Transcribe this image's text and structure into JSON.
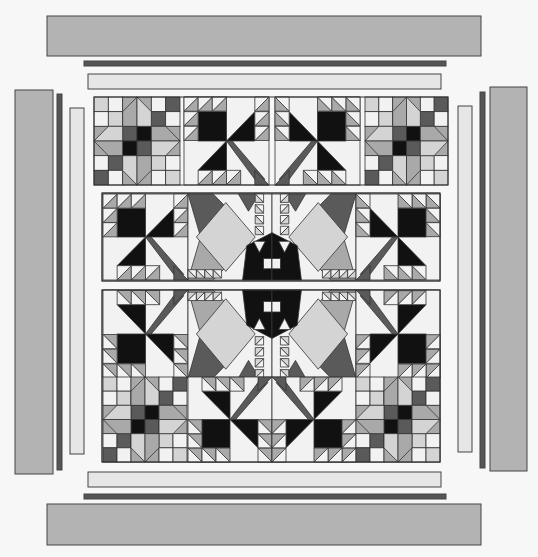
{
  "palette": {
    "white": "#f2f2f2",
    "light": "#d4d4d4",
    "mid": "#a9a9a9",
    "dark": "#5a5a5a",
    "black": "#111111",
    "border_outer": "#b3b3b3",
    "border_inner_dark": "#555555",
    "border_inner_light": "#e6e6e6"
  },
  "borders": [
    {
      "name": "top-outer-border",
      "side": "top",
      "fabric": "border_outer"
    },
    {
      "name": "top-dark-border",
      "side": "top",
      "fabric": "border_inner_dark"
    },
    {
      "name": "top-light-border",
      "side": "top",
      "fabric": "border_inner_light"
    },
    {
      "name": "bottom-light-border",
      "side": "bottom",
      "fabric": "border_inner_light"
    },
    {
      "name": "bottom-dark-border",
      "side": "bottom",
      "fabric": "border_inner_dark"
    },
    {
      "name": "bottom-outer-border",
      "side": "bottom",
      "fabric": "border_outer"
    },
    {
      "name": "left-outer-border",
      "side": "left",
      "fabric": "border_outer"
    },
    {
      "name": "left-dark-border",
      "side": "left",
      "fabric": "border_inner_dark"
    },
    {
      "name": "left-light-border",
      "side": "left",
      "fabric": "border_inner_light"
    },
    {
      "name": "right-light-border",
      "side": "right",
      "fabric": "border_inner_light"
    },
    {
      "name": "right-dark-border",
      "side": "right",
      "fabric": "border_inner_dark"
    },
    {
      "name": "right-outer-border",
      "side": "right",
      "fabric": "border_outer"
    }
  ],
  "rows": [
    {
      "name": "top-block-row",
      "blocks": [
        "star",
        "bear-paw-left",
        "bear-paw-right",
        "star"
      ]
    },
    {
      "name": "middle-block-row",
      "blocks": [
        "bear-paw-left",
        "medallion",
        "medallion",
        "bear-paw-right"
      ]
    },
    {
      "name": "bottom-block-row",
      "blocks": [
        "bear-paw-left",
        "medallion",
        "medallion",
        "bear-paw-right",
        "star",
        "bear-paw-up",
        "bear-paw-up",
        "star"
      ]
    }
  ]
}
